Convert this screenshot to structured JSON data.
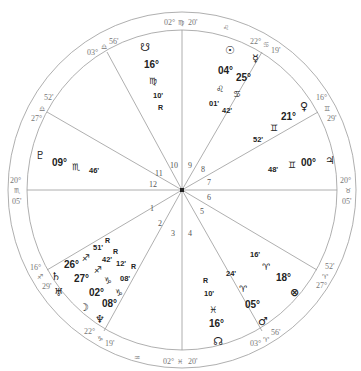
{
  "chart": {
    "center": [
      182,
      190
    ],
    "outer_radius": [
      174,
      178
    ],
    "inner_radius": [
      155,
      160
    ],
    "line_color": "#9a9a9a"
  },
  "cusps": [
    {
      "house": "1",
      "deg": "20°",
      "sign": "♏",
      "min": "05'"
    },
    {
      "house": "2",
      "deg": "16°",
      "sign": "♐",
      "min": "29'"
    },
    {
      "house": "3",
      "deg": "22°",
      "sign": "♑",
      "min": "19'"
    },
    {
      "house": "4",
      "deg": "02°",
      "sign": "♓",
      "min": "20'"
    },
    {
      "house": "5",
      "deg": "03°",
      "sign": "♈",
      "min": "56'"
    },
    {
      "house": "6",
      "deg": "27°",
      "sign": "♈",
      "min": "52'"
    },
    {
      "house": "7",
      "deg": "20°",
      "sign": "♉",
      "min": "05'"
    },
    {
      "house": "8",
      "deg": "16°",
      "sign": "♊",
      "min": "29'"
    },
    {
      "house": "9",
      "deg": "22°",
      "sign": "♋",
      "min": "19'"
    },
    {
      "house": "10",
      "deg": "02°",
      "sign": "♍",
      "min": "20'"
    },
    {
      "house": "11",
      "deg": "03°",
      "sign": "♎",
      "min": "56'"
    },
    {
      "house": "12",
      "deg": "27°",
      "sign": "♎",
      "min": "52'"
    }
  ],
  "intercepted_signs": {
    "top": "♌",
    "bottom": "♒"
  },
  "house_numbers": [
    "1",
    "2",
    "3",
    "4",
    "5",
    "6",
    "7",
    "8",
    "9",
    "10",
    "11",
    "12"
  ],
  "planets": [
    {
      "name": "South Node",
      "glyph": "☋",
      "deg": "16°",
      "sign": "♍",
      "min": "10'",
      "retro": "R"
    },
    {
      "name": "Sun",
      "glyph": "☉",
      "deg": "04°",
      "sign": "♌",
      "min": "01'"
    },
    {
      "name": "Mercury",
      "glyph": "☿",
      "deg": "25°",
      "sign": "♋",
      "min": "42'"
    },
    {
      "name": "Venus",
      "glyph": "♀",
      "deg": "21°",
      "sign": "♊",
      "min": "52'"
    },
    {
      "name": "Jupiter",
      "glyph": "♃",
      "deg": "00°",
      "sign": "♊",
      "min": "48'"
    },
    {
      "name": "Pluto",
      "glyph": "♇",
      "deg": "09°",
      "sign": "♏",
      "min": "46'"
    },
    {
      "name": "Saturn",
      "glyph": "♄",
      "deg": "26°",
      "sign": "♐",
      "min": "51'",
      "retro": "R"
    },
    {
      "name": "Uranus",
      "glyph": "♅",
      "deg": "27°",
      "sign": "♐",
      "min": "42'",
      "retro": "R"
    },
    {
      "name": "Moon",
      "glyph": "☽",
      "deg": "02°",
      "sign": "♑",
      "min": "12'",
      "retro": "R"
    },
    {
      "name": "Neptune",
      "glyph": "♆",
      "deg": "08°",
      "sign": "♑",
      "min": "08'"
    },
    {
      "name": "Part of Fortune",
      "glyph": "⊗",
      "deg": "18°",
      "sign": "♈",
      "min": "16'"
    },
    {
      "name": "Mars",
      "glyph": "♂",
      "deg": "05°",
      "sign": "♈",
      "min": "24'"
    },
    {
      "name": "North Node",
      "glyph": "☊",
      "deg": "16°",
      "sign": "♓",
      "min": "10'",
      "retro": "R"
    }
  ]
}
